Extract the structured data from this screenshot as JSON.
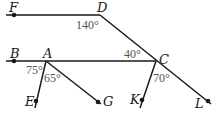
{
  "diagram": {
    "type": "geometry-angles",
    "points": {
      "F": "F",
      "D": "D",
      "B": "B",
      "A": "A",
      "C": "C",
      "E": "E",
      "G": "G",
      "K": "K",
      "L": "L"
    },
    "angles": {
      "FDC": "140°",
      "BCD": "40°",
      "BAE": "75°",
      "EAG": "65°",
      "KCL": "70°"
    },
    "segments": [
      "FD",
      "DL",
      "BC",
      "AE",
      "AG",
      "CK"
    ],
    "colors": {
      "line": "#1a1a1a",
      "angle_label": "#555555"
    }
  }
}
